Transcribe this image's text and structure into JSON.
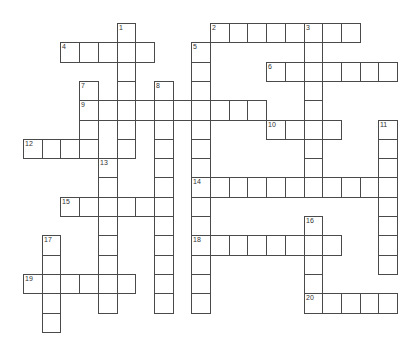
{
  "puzzle": {
    "type": "crossword",
    "grid": {
      "origin_x": 23,
      "origin_y": 23,
      "cell_w": 18.7,
      "cell_h": 19.3,
      "cols": 20,
      "rows": 16
    },
    "colors": {
      "border": "#4a4a4a",
      "cell_bg": "#ffffff",
      "number": "#333333"
    },
    "words": [
      {
        "number": "1",
        "direction": "down",
        "row": 0,
        "col": 5,
        "length": 7
      },
      {
        "number": "2",
        "direction": "across",
        "row": 0,
        "col": 10,
        "length": 8
      },
      {
        "number": "3",
        "direction": "down",
        "row": 0,
        "col": 15,
        "length": 9
      },
      {
        "number": "4",
        "direction": "across",
        "row": 1,
        "col": 2,
        "length": 5
      },
      {
        "number": "5",
        "direction": "down",
        "row": 1,
        "col": 9,
        "length": 14
      },
      {
        "number": "6",
        "direction": "across",
        "row": 2,
        "col": 13,
        "length": 7
      },
      {
        "number": "7",
        "direction": "down",
        "row": 3,
        "col": 3,
        "length": 4
      },
      {
        "number": "8",
        "direction": "down",
        "row": 3,
        "col": 7,
        "length": 12
      },
      {
        "number": "9",
        "direction": "across",
        "row": 4,
        "col": 3,
        "length": 10
      },
      {
        "number": "10",
        "direction": "across",
        "row": 5,
        "col": 13,
        "length": 4
      },
      {
        "number": "11",
        "direction": "down",
        "row": 5,
        "col": 19,
        "length": 8
      },
      {
        "number": "12",
        "direction": "across",
        "row": 6,
        "col": 0,
        "length": 4
      },
      {
        "number": "13",
        "direction": "down",
        "row": 7,
        "col": 4,
        "length": 8
      },
      {
        "number": "14",
        "direction": "across",
        "row": 8,
        "col": 9,
        "length": 11
      },
      {
        "number": "15",
        "direction": "across",
        "row": 9,
        "col": 2,
        "length": 6
      },
      {
        "number": "16",
        "direction": "down",
        "row": 10,
        "col": 15,
        "length": 5
      },
      {
        "number": "17",
        "direction": "down",
        "row": 11,
        "col": 1,
        "length": 5
      },
      {
        "number": "18",
        "direction": "across",
        "row": 11,
        "col": 9,
        "length": 8
      },
      {
        "number": "19",
        "direction": "across",
        "row": 13,
        "col": 0,
        "length": 6
      },
      {
        "number": "20",
        "direction": "across",
        "row": 14,
        "col": 15,
        "length": 5
      }
    ]
  }
}
